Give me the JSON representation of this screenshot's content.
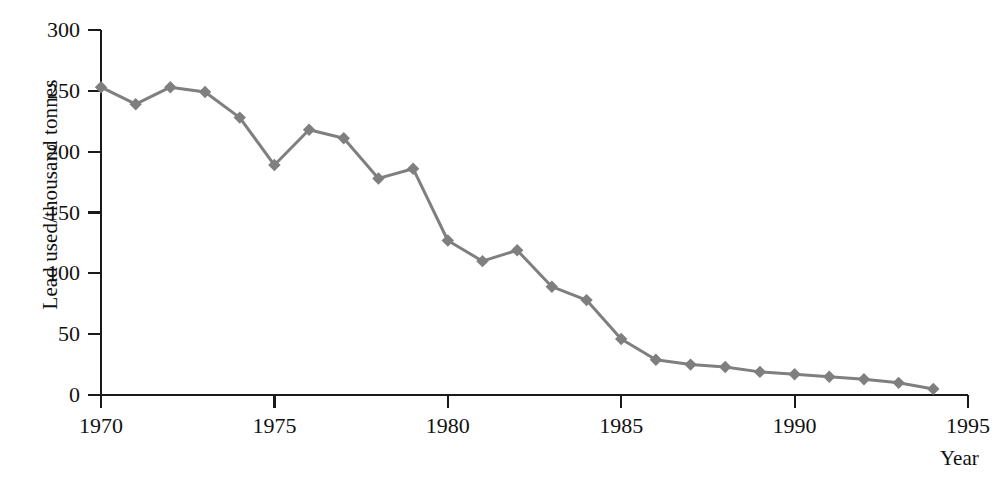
{
  "chart_data": {
    "type": "line",
    "title": "",
    "subtitle": "",
    "xlabel": "Year",
    "ylabel": "Lead used/thousand tonnes",
    "xlim": [
      1970,
      1995
    ],
    "ylim": [
      0,
      300
    ],
    "xticks": [
      1970,
      1975,
      1980,
      1985,
      1990,
      1995
    ],
    "xtick_labels": [
      "1970",
      "1975",
      "1980",
      "1985",
      "1990",
      "1995"
    ],
    "yticks": [
      0,
      50,
      100,
      150,
      200,
      250,
      300
    ],
    "ytick_labels": [
      "0",
      "50",
      "100",
      "150",
      "200",
      "250",
      "300"
    ],
    "grid": false,
    "legend": false,
    "legend_position": "none",
    "marker": "diamond",
    "series_color": "#7f7f7f",
    "axis_color": "#1a1a1a",
    "background_color": "#ffffff",
    "x": [
      1970,
      1971,
      1972,
      1973,
      1974,
      1975,
      1976,
      1977,
      1978,
      1979,
      1980,
      1981,
      1982,
      1983,
      1984,
      1985,
      1986,
      1987,
      1988,
      1989,
      1990,
      1991,
      1992,
      1993,
      1994
    ],
    "series": [
      {
        "name": "Lead used",
        "values": [
          253,
          239,
          253,
          249,
          228,
          189,
          218,
          211,
          178,
          186,
          127,
          110,
          119,
          89,
          78,
          46,
          29,
          25,
          23,
          19,
          17,
          15,
          13,
          10,
          5
        ]
      }
    ]
  }
}
